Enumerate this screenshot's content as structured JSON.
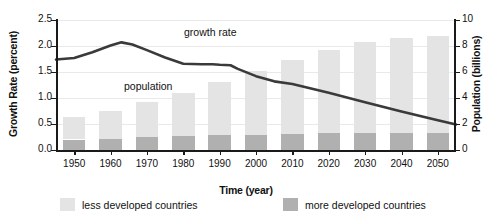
{
  "chart_data": {
    "type": "bar",
    "title": "",
    "subtitle": "",
    "xlabel": "Time (year)",
    "ylabel": "Growth Rate (percent)",
    "ylabel_right": "Population (billions)",
    "grid": true,
    "legend_position": "bottom",
    "categories": [
      "1950",
      "1960",
      "1970",
      "1980",
      "1990",
      "2000",
      "2010",
      "2020",
      "2030",
      "2040",
      "2050"
    ],
    "x": [
      1950,
      1960,
      1970,
      1980,
      1990,
      2000,
      2010,
      2020,
      2030,
      2040,
      2050
    ],
    "ylim_left": [
      0.0,
      2.5
    ],
    "ylim_right": [
      0,
      10
    ],
    "yticks_left": [
      "0.0",
      "0.5",
      "1.0",
      "1.5",
      "2.0",
      "2.5"
    ],
    "ytick_values_left": [
      0.0,
      0.5,
      1.0,
      1.5,
      2.0,
      2.5
    ],
    "yticks_right": [
      "0",
      "2",
      "4",
      "6",
      "8",
      "10"
    ],
    "ytick_values_right": [
      0,
      2,
      4,
      6,
      8,
      10
    ],
    "series": [
      {
        "name": "more developed countries",
        "type": "bar",
        "stack": "population",
        "axis": "right",
        "unit": "billions",
        "color": "#b0b0b0",
        "values": [
          0.81,
          0.86,
          1.01,
          1.08,
          1.12,
          1.19,
          1.24,
          1.28,
          1.3,
          1.3,
          1.3
        ]
      },
      {
        "name": "less developed countries",
        "type": "bar",
        "stack": "population",
        "axis": "right",
        "unit": "billions",
        "color": "#e4e4e4",
        "values": [
          1.71,
          2.14,
          2.69,
          3.32,
          4.08,
          4.89,
          5.66,
          6.42,
          7.0,
          7.3,
          7.5
        ]
      },
      {
        "name": "population",
        "type": "bar-total",
        "axis": "right",
        "unit": "billions",
        "values": [
          2.52,
          3.0,
          3.7,
          4.4,
          5.2,
          6.08,
          6.9,
          7.7,
          8.3,
          8.6,
          8.8
        ]
      },
      {
        "name": "growth rate",
        "type": "line",
        "axis": "left",
        "unit": "percent",
        "color": "#3a3a3a",
        "x": [
          1945,
          1950,
          1955,
          1960,
          1963,
          1966,
          1970,
          1975,
          1980,
          1985,
          1988,
          1990,
          1993,
          1995,
          2000,
          2005,
          2010,
          2020,
          2030,
          2040,
          2050,
          2055
        ],
        "values": [
          1.74,
          1.77,
          1.88,
          2.01,
          2.07,
          2.03,
          1.92,
          1.78,
          1.66,
          1.65,
          1.65,
          1.64,
          1.63,
          1.56,
          1.42,
          1.32,
          1.27,
          1.1,
          0.92,
          0.74,
          0.57,
          0.49
        ]
      }
    ],
    "annotations": [
      {
        "name": "growth-rate-label",
        "text": "growth rate",
        "x": 1978,
        "y": 2.35
      },
      {
        "name": "population-label",
        "text": "population",
        "x": 1965,
        "y": 1.1
      }
    ]
  },
  "legend": {
    "items": [
      {
        "label": "less developed countries",
        "color": "#e4e4e4"
      },
      {
        "label": "more developed countries",
        "color": "#b0b0b0"
      }
    ]
  },
  "colors": {
    "less_developed": "#e4e4e4",
    "more_developed": "#b0b0b0",
    "line": "#3a3a3a",
    "axis": "#1a1a1a",
    "grid": "#e9e9e9",
    "background": "#ffffff"
  }
}
